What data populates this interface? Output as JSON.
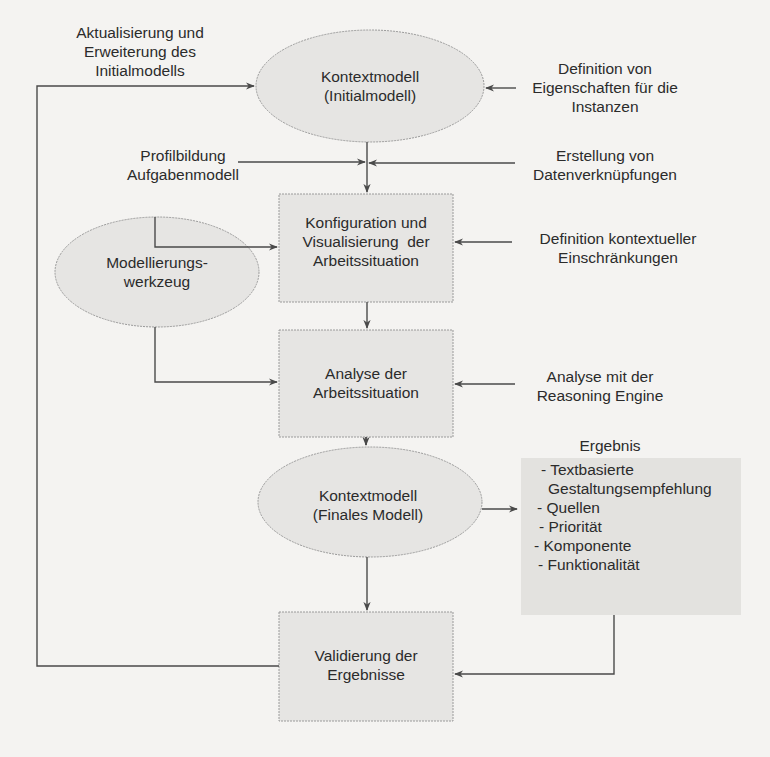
{
  "diagram": {
    "nodes": {
      "initial_model": {
        "line1": "Kontextmodell",
        "line2": "(Initialmodell)"
      },
      "configuration": {
        "line1": "Konfiguration und",
        "line2": "Visualisierung  der",
        "line3": "Arbeitssituation"
      },
      "modeling_tool": {
        "line1": "Modellierungs-",
        "line2": "werkzeug"
      },
      "analysis": {
        "line1": "Analyse der",
        "line2": "Arbeitssituation"
      },
      "final_model": {
        "line1": "Kontextmodell",
        "line2": "(Finales Modell)"
      },
      "validation": {
        "line1": "Validierung der",
        "line2": "Ergebnisse"
      }
    },
    "labels": {
      "update_extension": {
        "line1": "Aktualisierung und",
        "line2": "Erweiterung des",
        "line3": "Initialmodells"
      },
      "define_properties": {
        "line1": "Definition von",
        "line2": "Eigenschaften für die",
        "line3": "Instanzen"
      },
      "profiling": {
        "line1": "Profilbildung",
        "line2": "Aufgabenmodell"
      },
      "data_links": {
        "line1": "Erstellung von",
        "line2": "Datenverknüpfungen"
      },
      "contextual_constraints": {
        "line1": "Definition kontextueller",
        "line2": "Einschränkungen"
      },
      "reasoning": {
        "line1": "Analyse mit der",
        "line2": "Reasoning Engine"
      }
    },
    "result": {
      "title": "Ergebnis",
      "items": [
        "- Textbasierte",
        "  Gestaltungsempfehlung",
        "- Quellen",
        "- Priorität",
        "- Komponente",
        "- Funktionalität"
      ]
    },
    "colors": {
      "background": "#f4f3f1",
      "node_fill": "#e6e5e3",
      "result_fill": "#e3e2df",
      "line": "#4a4a4a",
      "node_border": "#9a9a9a"
    }
  }
}
